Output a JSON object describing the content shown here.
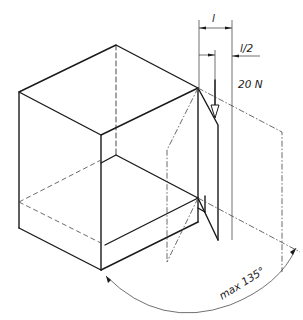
{
  "figure": {
    "type": "technical-drawing"
  },
  "labels": {
    "dim_full": "l",
    "dim_half": "l/2",
    "force": "20 N",
    "angle": "max 135°"
  },
  "colors": {
    "line": "#1a1a1a",
    "background": "#ffffff"
  }
}
